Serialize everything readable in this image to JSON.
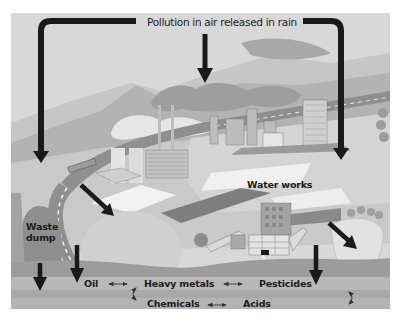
{
  "diagram": {
    "title": "Pollution in air released in rain",
    "labels": {
      "water_works": "Water works",
      "waste_dump_line1": "Waste",
      "waste_dump_line2": "dump"
    },
    "groundwater_pollutants": {
      "row1": [
        "Oil",
        "Heavy metals",
        "Pesticides"
      ],
      "row2": [
        "Chemicals",
        "Acids"
      ]
    },
    "relations": [
      {
        "from": "Oil",
        "to": "Heavy metals",
        "type": "double-arrow"
      },
      {
        "from": "Heavy metals",
        "to": "Pesticides",
        "type": "double-arrow"
      },
      {
        "from": "Chemicals",
        "to": "Acids",
        "type": "double-arrow"
      },
      {
        "from": "Heavy metals",
        "to": "Chemicals",
        "type": "curved-double-arrow"
      },
      {
        "from": "Pesticides",
        "to": "Acids",
        "type": "curved-double-arrow"
      }
    ],
    "colors": {
      "sky": "#d9d9d9",
      "arrow": "#1a1a1a",
      "ground_band": "#a9a9a9",
      "text": "#1c1c1c"
    }
  }
}
